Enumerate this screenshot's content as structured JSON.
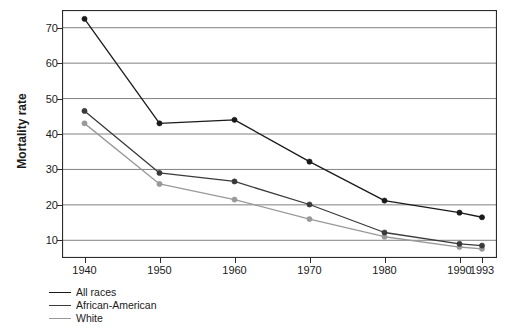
{
  "chart_data": {
    "type": "line",
    "title": "",
    "xlabel": "",
    "ylabel": "Mortality rate",
    "x": [
      1940,
      1950,
      1960,
      1970,
      1980,
      1990,
      1993
    ],
    "categories": [
      "1940",
      "1950",
      "1960",
      "1970",
      "1980",
      "1990",
      "1993"
    ],
    "xlim": [
      1937,
      1995
    ],
    "ylim": [
      5,
      75
    ],
    "yticks": [
      10,
      20,
      30,
      40,
      50,
      60,
      70
    ],
    "ytick_labels": [
      "10",
      "20",
      "30",
      "40",
      "50",
      "60",
      "70"
    ],
    "grid": "horizontal",
    "legend_position": "below-left",
    "series": [
      {
        "name": "All races",
        "color": "#1a1a1a",
        "values": [
          72.5,
          43.0,
          44.0,
          32.2,
          21.2,
          17.8,
          16.5
        ]
      },
      {
        "name": "African-American",
        "color": "#3a3a3a",
        "values": [
          46.5,
          29.0,
          26.6,
          20.1,
          12.2,
          9.0,
          8.5
        ]
      },
      {
        "name": "White",
        "color": "#999999",
        "values": [
          43.0,
          25.9,
          21.5,
          16.0,
          11.0,
          8.1,
          7.6
        ]
      }
    ]
  },
  "colors": {
    "frame": "#2b2b2b",
    "grid": "#808080",
    "text": "#1a1a1a",
    "background": "#ffffff"
  },
  "legend": {
    "items": [
      {
        "label": "All races",
        "color": "#1a1a1a"
      },
      {
        "label": "African-American",
        "color": "#3a3a3a"
      },
      {
        "label": "White",
        "color": "#999999"
      }
    ]
  }
}
